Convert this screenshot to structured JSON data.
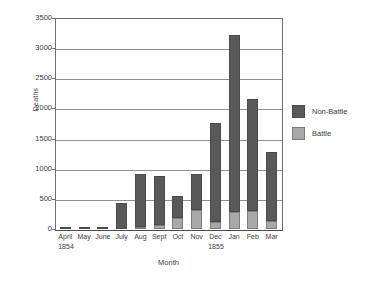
{
  "chart_data": {
    "type": "bar",
    "stacked": true,
    "title": "",
    "xlabel": "Month",
    "ylabel": "Deaths",
    "ylim": [
      0,
      3500
    ],
    "ytick_step": 500,
    "yticks": [
      "3500",
      "3000",
      "2500",
      "2000",
      "1500",
      "1000",
      "500",
      "0"
    ],
    "grid": "horizontal",
    "legend_position": "right",
    "categories": [
      "April",
      "May",
      "June",
      "July",
      "Aug",
      "Sept",
      "Oct",
      "Nov",
      "Dec",
      "Jan",
      "Feb",
      "Mar"
    ],
    "category_groups": [
      {
        "label": "1854",
        "start_index": 0
      },
      {
        "label": "1855",
        "start_index": 9
      }
    ],
    "series": [
      {
        "name": "Battle",
        "color": "#a8a8a8",
        "values": [
          0,
          0,
          0,
          0,
          30,
          70,
          175,
          310,
          115,
          275,
          305,
          140
        ]
      },
      {
        "name": "Non-Battle",
        "color": "#595959",
        "values": [
          20,
          30,
          20,
          433,
          887,
          805,
          370,
          610,
          1640,
          2942,
          1845,
          1143
        ]
      }
    ],
    "totals": [
      20,
      30,
      20,
      433,
      917,
      875,
      545,
      920,
      1755,
      3217,
      2150,
      1283
    ]
  },
  "legend": {
    "items": [
      {
        "label": "Non-Battle",
        "swatch": "nonbattle"
      },
      {
        "label": "Battle",
        "swatch": "battle"
      }
    ]
  },
  "axis": {
    "y_title": "Deaths",
    "x_title": "Month"
  }
}
